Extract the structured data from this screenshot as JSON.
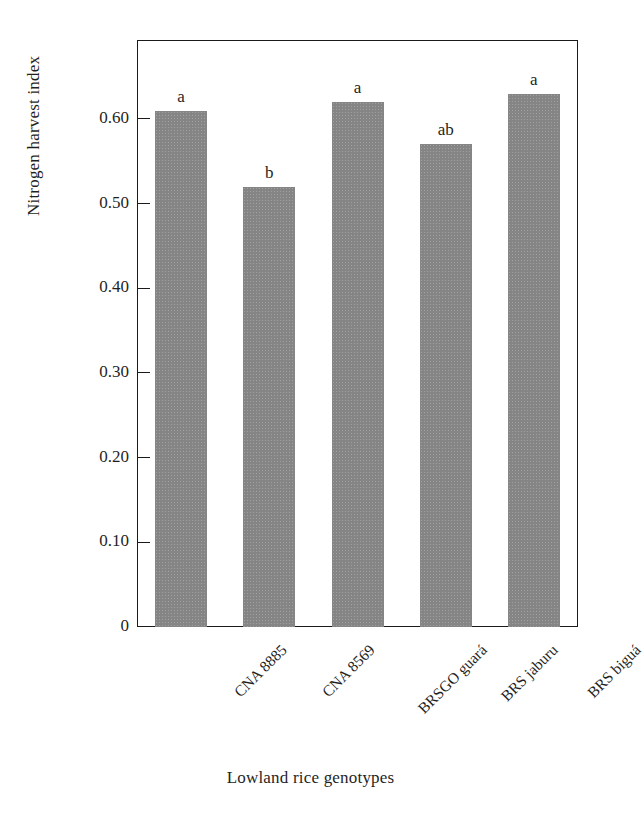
{
  "chart_data": {
    "type": "bar",
    "title": "",
    "subtitle": "",
    "xlabel": "Lowland rice genotypes",
    "ylabel": "Nitrogen harvest index",
    "categories": [
      "CNA 8885",
      "CNA 8569",
      "BRSGO guará",
      "BRS jaburu",
      "BRS biguá"
    ],
    "values": [
      0.61,
      0.52,
      0.62,
      0.57,
      0.63
    ],
    "annotations": [
      "a",
      "b",
      "a",
      "ab",
      "a"
    ],
    "ylim": [
      0,
      0.69
    ],
    "yticks": [
      0,
      0.1,
      0.2,
      0.3,
      0.4,
      0.5,
      0.6
    ],
    "ytick_labels": [
      "0",
      "0.10",
      "0.20",
      "0.30",
      "0.40",
      "0.50",
      "0.60"
    ],
    "grid": false,
    "legend": null,
    "bar_color": "#858585",
    "axis_color": "#1a1a1a",
    "text_color": "#1f1f1f",
    "background": "#ffffff"
  }
}
